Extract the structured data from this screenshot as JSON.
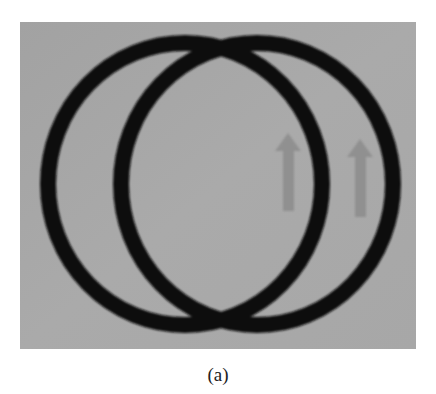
{
  "figure": {
    "caption": "(a)",
    "background_color": "#a6a6a6",
    "ring_color": "#111111",
    "arrow_color": "#8c8c8c",
    "rings": [
      {
        "name": "left-ring",
        "cx": 185,
        "cy": 184,
        "rx": 137,
        "ry": 141,
        "stroke": 16
      },
      {
        "name": "right-ring",
        "cx": 257,
        "cy": 184,
        "rx": 136,
        "ry": 141,
        "stroke": 16
      }
    ],
    "arrows": [
      {
        "name": "left-arrow",
        "direction": "up",
        "x": 288,
        "y_top": 133,
        "y_bottom": 211
      },
      {
        "name": "right-arrow",
        "direction": "up",
        "x": 360,
        "y_top": 139,
        "y_bottom": 217
      }
    ]
  }
}
